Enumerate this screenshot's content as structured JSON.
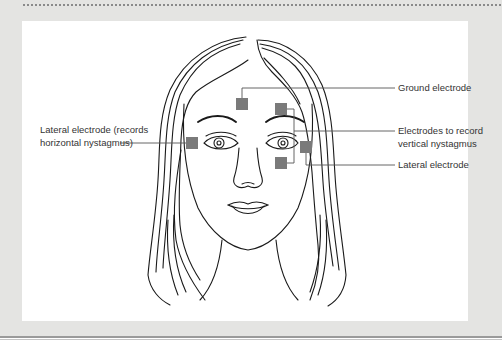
{
  "figure": {
    "labels": {
      "ground": "Ground electrode",
      "lateral_left_line1": "Lateral electrode (records",
      "lateral_left_line2": "horizontal nystagmus)",
      "vertical_line1": "Electrodes to record",
      "vertical_line2": "vertical nystagmus",
      "lateral_right": "Lateral electrode"
    },
    "electrodes": [
      {
        "name": "ground",
        "x": 242,
        "y": 98
      },
      {
        "name": "lateral-left",
        "x": 186,
        "y": 137
      },
      {
        "name": "vertical-upper",
        "x": 275,
        "y": 103
      },
      {
        "name": "vertical-lower",
        "x": 275,
        "y": 157
      },
      {
        "name": "lateral-right",
        "x": 300,
        "y": 141
      }
    ],
    "colors": {
      "frame": "#e4e4e2",
      "panel": "#ffffff",
      "electrode": "#7a7a7a",
      "leader_line": "#555555",
      "ink": "#1a1a1a"
    }
  }
}
